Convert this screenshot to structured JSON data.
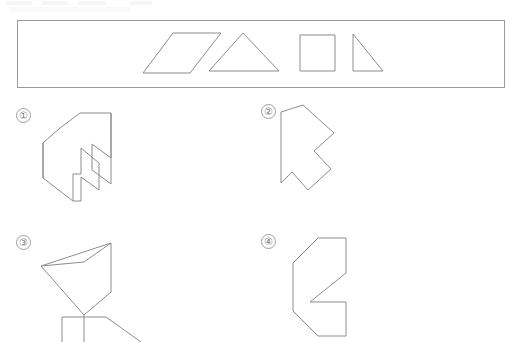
{
  "page": {
    "width": 521,
    "height": 342,
    "background_color": "#ffffff",
    "stroke_color": "#8c8c8c",
    "label_color": "#7a7a7a",
    "question_type": "shape-assembly-multiple-choice",
    "cropped_header_text": ""
  },
  "piece_bank": {
    "name": "piece-bank",
    "border_color": "#9a9a9a",
    "rect": {
      "x": 17,
      "y": 20,
      "w": 488,
      "h": 68
    },
    "pieces": [
      {
        "id": "piece-parallelogram",
        "shape": "parallelogram",
        "points": "173,33 221,33 190,73 143,73"
      },
      {
        "id": "piece-triangle",
        "shape": "isosceles-triangle",
        "points": "243,33 279,71 209,71"
      },
      {
        "id": "piece-square",
        "shape": "square",
        "points": "300,35 335,35 335,71 300,71"
      },
      {
        "id": "piece-right-triangle",
        "shape": "right-triangle",
        "points": "353,34 353,71 383,71"
      }
    ]
  },
  "options": [
    {
      "id": "option-1",
      "label": "①",
      "label_plain": "1",
      "points": "43,145 43,178 73,201 81,201 81,177 99,190 99,163 81,148 81,174 73,174 73,143 60,128 80,113 111,113 111,158 92,144 92,170 111,184 111,113"
    },
    {
      "id": "option-2",
      "label": "②",
      "label_plain": "2",
      "points": "282,112 282,182 292,171 308,189 330,168 314,150 333,133 303,105 282,112"
    },
    {
      "id": "option-3",
      "label": "③",
      "label_plain": "3",
      "points": "41,266 85,255 111,243 111,292 84,315 41,266"
    },
    {
      "id": "option-4",
      "label": "④",
      "label_plain": "4",
      "points": "318,238 346,238 346,273 310,302 346,302 346,336 318,336 293,311 293,263 318,238"
    }
  ]
}
